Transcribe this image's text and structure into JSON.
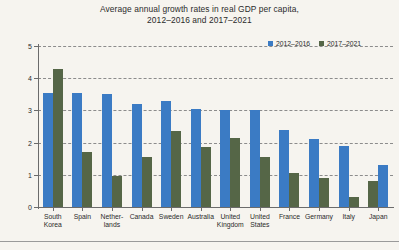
{
  "chart_data": {
    "type": "bar",
    "title": "Average annual growth rates in real GDP per capita,",
    "subtitle": "2012–2016 and 2017–2021",
    "xlabel": "",
    "ylabel": "Percent",
    "ylim": [
      0,
      5
    ],
    "yticks": [
      0,
      1,
      2,
      3,
      4,
      5
    ],
    "ytick_labels": [
      "0",
      "1",
      "2",
      "3",
      "4",
      "5"
    ],
    "grid": true,
    "legend_position": "top-right",
    "categories": [
      "South Korea",
      "Spain",
      "Netherlands",
      "Canada",
      "Sweden",
      "Australia",
      "United Kingdom",
      "United States",
      "France",
      "Germany",
      "Italy",
      "Japan"
    ],
    "category_lines": [
      [
        "South",
        "Korea"
      ],
      [
        "Spain"
      ],
      [
        "Nether-",
        "lands"
      ],
      [
        "Canada"
      ],
      [
        "Sweden"
      ],
      [
        "Australia"
      ],
      [
        "United",
        "Kingdom"
      ],
      [
        "United",
        "States"
      ],
      [
        "France"
      ],
      [
        "Germany"
      ],
      [
        "Italy"
      ],
      [
        "Japan"
      ]
    ],
    "series": [
      {
        "name": "2012–2016",
        "color": "#3b7bc4",
        "values": [
          3.55,
          3.55,
          3.5,
          3.2,
          3.3,
          3.05,
          3.0,
          3.0,
          2.4,
          2.1,
          1.9,
          1.3
        ]
      },
      {
        "name": "2017–2021",
        "color": "#556647",
        "values": [
          4.3,
          1.7,
          0.95,
          1.55,
          2.35,
          1.85,
          2.15,
          1.55,
          1.05,
          0.9,
          0.3,
          0.8
        ]
      }
    ],
    "series_order_by_group": [
      [
        "2012–2016",
        "2017–2021"
      ],
      [
        "2012–2016",
        "2017–2021"
      ],
      [
        "2012–2016",
        "2017–2021"
      ],
      [
        "2012–2016",
        "2017–2021"
      ],
      [
        "2012–2016",
        "2017–2021"
      ],
      [
        "2012–2016",
        "2017–2021"
      ],
      [
        "2012–2016",
        "2017–2021"
      ],
      [
        "2012–2016",
        "2017–2021"
      ],
      [
        "2012–2016",
        "2017–2021"
      ],
      [
        "2012–2016",
        "2017–2021"
      ],
      [
        "2012–2016",
        "2017–2021"
      ],
      [
        "2017–2021",
        "2012–2016"
      ]
    ]
  },
  "legend": {
    "entries": [
      {
        "label": "2012–2016",
        "color": "#3b7bc4"
      },
      {
        "label": "2017–2021",
        "color": "#556647"
      }
    ]
  },
  "colors": {
    "background": "#f6f4ef",
    "series_1": "#3b7bc4",
    "series_2": "#556647",
    "axis": "#6b6b6b",
    "grid": "#8c8c8c",
    "text": "#2b2b2b"
  }
}
